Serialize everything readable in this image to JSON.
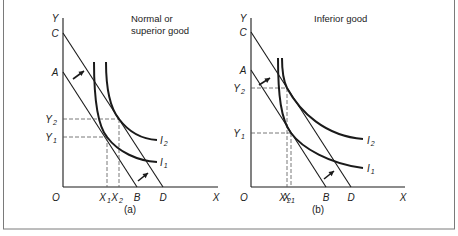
{
  "figure": {
    "border_color": "#7a7a7a",
    "ink": "#1a1a1a",
    "background": "#ffffff"
  },
  "panels": [
    {
      "id": "a",
      "caption": "(a)",
      "title_lines": [
        "Normal or",
        "superior good"
      ],
      "axis": {
        "y_label": "Y",
        "x_label": "X",
        "origin_label": "O"
      },
      "budget_lines": [
        {
          "name": "AB",
          "start_label": "A",
          "end_label": "B"
        },
        {
          "name": "CD",
          "start_label": "C",
          "end_label": "D"
        }
      ],
      "indifference_curves": [
        {
          "label": "I",
          "sub": "1"
        },
        {
          "label": "I",
          "sub": "2"
        }
      ],
      "equilibria": [
        {
          "x_label": "X",
          "x_sub": "1",
          "y_label": "Y",
          "y_sub": "1"
        },
        {
          "x_label": "X",
          "x_sub": "2",
          "y_label": "Y",
          "y_sub": "2"
        }
      ]
    },
    {
      "id": "b",
      "caption": "(b)",
      "title_lines": [
        "Inferior good"
      ],
      "axis": {
        "y_label": "Y",
        "x_label": "X",
        "origin_label": "O"
      },
      "budget_lines": [
        {
          "name": "AB",
          "start_label": "A",
          "end_label": "B"
        },
        {
          "name": "CD",
          "start_label": "C",
          "end_label": "D"
        }
      ],
      "indifference_curves": [
        {
          "label": "I",
          "sub": "1"
        },
        {
          "label": "I",
          "sub": "2"
        }
      ],
      "equilibria": [
        {
          "x_label": "X",
          "x_sub": "1",
          "y_label": "Y",
          "y_sub": "1"
        },
        {
          "x_label": "X",
          "x_sub": "2",
          "y_label": "Y",
          "y_sub": "2"
        }
      ]
    }
  ],
  "geometry": {
    "a": {
      "origin": [
        63,
        187
      ],
      "y_top": 18,
      "x_end": 218,
      "A": [
        63,
        72
      ],
      "B": [
        137,
        187
      ],
      "C": [
        63,
        33
      ],
      "D": [
        163,
        187
      ],
      "I1": "M94,62 C94,95 97,125 107,137 C118,152 138,161 157,162",
      "I2": "M106,62 C106,90 110,108 119,119 C128,131 140,139 157,140",
      "E1": [
        107,
        137
      ],
      "E2": [
        119,
        119
      ],
      "arrow_up": [
        [
          73,
          79
        ],
        [
          84,
          71
        ]
      ],
      "arrow_down": [
        [
          138,
          181
        ],
        [
          148,
          173
        ]
      ],
      "I1_label": [
        160,
        166
      ],
      "I2_label": [
        160,
        144
      ],
      "title_pos": [
        131,
        22
      ],
      "caption_pos": [
        130,
        213
      ]
    },
    "b": {
      "origin": [
        251,
        187
      ],
      "y_top": 18,
      "x_end": 405,
      "A": [
        251,
        70
      ],
      "B": [
        326,
        187
      ],
      "C": [
        251,
        32
      ],
      "D": [
        351,
        187
      ],
      "I1": "M278,58 C278,95 281,120 291,133 C302,148 330,164 363,168",
      "I2": "M282,58 C282,72 283,80 287,88 C300,112 325,136 363,139",
      "E1": [
        291,
        133
      ],
      "E2": [
        287,
        88
      ],
      "arrow_up": [
        [
          259,
          85
        ],
        [
          270,
          78
        ]
      ],
      "arrow_down": [
        [
          324,
          179
        ],
        [
          334,
          171
        ]
      ],
      "I1_label": [
        367,
        172
      ],
      "I2_label": [
        367,
        144
      ],
      "title_pos": [
        314,
        22
      ],
      "caption_pos": [
        318,
        213
      ]
    }
  }
}
